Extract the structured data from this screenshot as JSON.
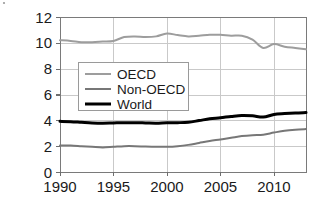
{
  "chart_data": {
    "type": "line",
    "title": "",
    "xlabel": "",
    "ylabel": "G/P(t CO2)",
    "xlim": [
      1990,
      2013
    ],
    "ylim": [
      0,
      12
    ],
    "grid": true,
    "legend_position": "upper-left-inside",
    "x_ticks": [
      "1990",
      "1995",
      "2000",
      "2005",
      "2010"
    ],
    "x_tick_values": [
      1990,
      1995,
      2000,
      2005,
      2010
    ],
    "y_ticks": [
      "0",
      "2",
      "4",
      "6",
      "8",
      "10",
      "12"
    ],
    "y_tick_values": [
      0,
      2,
      4,
      6,
      8,
      10,
      12
    ],
    "x": [
      1990,
      1991,
      1992,
      1993,
      1994,
      1995,
      1996,
      1997,
      1998,
      1999,
      2000,
      2001,
      2002,
      2003,
      2004,
      2005,
      2006,
      2007,
      2008,
      2009,
      2010,
      2011,
      2012,
      2013
    ],
    "series": [
      {
        "name": "OECD",
        "color": "#9d9d9d",
        "width": 2.0,
        "values": [
          10.2,
          10.15,
          10.05,
          10.05,
          10.1,
          10.15,
          10.45,
          10.5,
          10.45,
          10.5,
          10.72,
          10.6,
          10.5,
          10.55,
          10.62,
          10.62,
          10.55,
          10.55,
          10.25,
          9.6,
          9.9,
          9.7,
          9.6,
          9.5
        ]
      },
      {
        "name": "Non-OECD",
        "color": "#777777",
        "width": 2.0,
        "values": [
          2.05,
          2.05,
          2.0,
          1.95,
          1.9,
          1.95,
          2.0,
          2.0,
          1.97,
          1.95,
          1.95,
          2.0,
          2.1,
          2.25,
          2.4,
          2.52,
          2.65,
          2.78,
          2.85,
          2.88,
          3.05,
          3.2,
          3.28,
          3.32
        ]
      },
      {
        "name": "World",
        "color": "#000000",
        "width": 3.0,
        "values": [
          3.92,
          3.9,
          3.85,
          3.8,
          3.78,
          3.8,
          3.82,
          3.82,
          3.8,
          3.78,
          3.82,
          3.82,
          3.85,
          3.98,
          4.12,
          4.2,
          4.3,
          4.38,
          4.35,
          4.25,
          4.45,
          4.52,
          4.57,
          4.6
        ]
      }
    ]
  }
}
